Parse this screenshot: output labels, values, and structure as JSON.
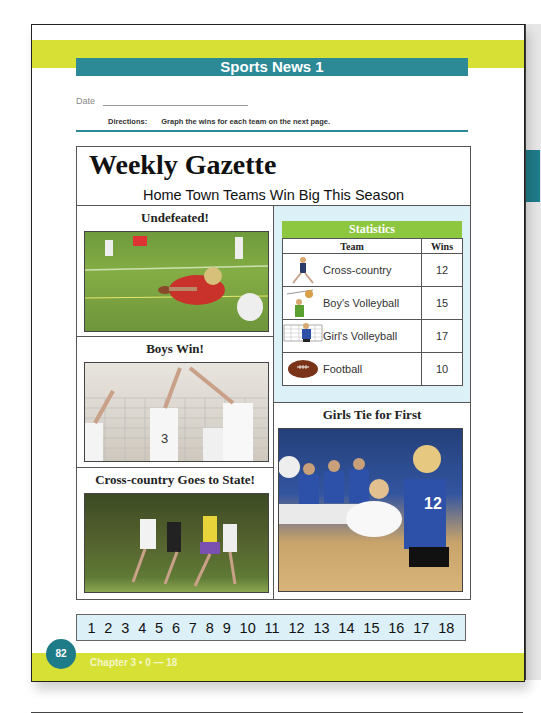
{
  "header": {
    "title": "Sports News  1",
    "date_label": "Date",
    "directions_label": "Directions:",
    "directions_text": "Graph the wins for each team on the next page."
  },
  "gazette": {
    "title": "Weekly Gazette",
    "subtitle": "Home Town Teams Win Big This Season",
    "stories": [
      {
        "headline": "Undefeated!",
        "photo": "football-player-diving"
      },
      {
        "headline": "Boys Win!",
        "photo": "boys-volleyball-block"
      },
      {
        "headline": "Cross-country Goes to State!",
        "photo": "cross-country-runners"
      },
      {
        "headline": "Girls Tie for First",
        "photo": "girls-volleyball-dig"
      }
    ],
    "statistics": {
      "title": "Statistics",
      "columns": [
        "Team",
        "Wins"
      ],
      "rows": [
        {
          "team": "Cross-country",
          "wins": "12",
          "icon": "runner-icon"
        },
        {
          "team": "Boy's Volleyball",
          "wins": "15",
          "icon": "volleyball-boy-icon"
        },
        {
          "team": "Girl's Volleyball",
          "wins": "17",
          "icon": "volleyball-girl-icon"
        },
        {
          "team": "Football",
          "wins": "10",
          "icon": "football-icon"
        }
      ]
    }
  },
  "number_line": [
    "1",
    "2",
    "3",
    "4",
    "5",
    "6",
    "7",
    "8",
    "9",
    "10",
    "11",
    "12",
    "13",
    "14",
    "15",
    "16",
    "17",
    "18"
  ],
  "footer": {
    "page_number": "82",
    "chapter_text": "Chapter 3  •  0 — 18"
  },
  "colors": {
    "teal": "#2b8a96",
    "lime": "#d7e035",
    "green": "#8dc63f",
    "light_blue": "#dcf0f8"
  }
}
